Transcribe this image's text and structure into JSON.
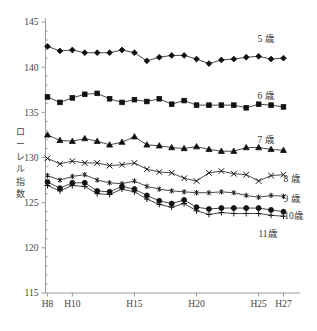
{
  "chart_data": {
    "type": "line",
    "title": "",
    "xlabel": "",
    "ylabel": "ローレル指数",
    "ylim": [
      115,
      145
    ],
    "y_ticks": [
      115,
      120,
      125,
      130,
      135,
      140,
      145
    ],
    "grid": false,
    "legend_position": "right-inline",
    "x": [
      "H8",
      "H9",
      "H10",
      "H11",
      "H12",
      "H13",
      "H14",
      "H15",
      "H16",
      "H17",
      "H18",
      "H19",
      "H20",
      "H21",
      "H22",
      "H23",
      "H24",
      "H25",
      "H26",
      "H27"
    ],
    "x_tick_labels": [
      "H8",
      "H10",
      "H15",
      "H20",
      "H25",
      "H27"
    ],
    "x_tick_values": [
      "H8",
      "H10",
      "H15",
      "H20",
      "H25",
      "H27"
    ],
    "series": [
      {
        "name": "5歳",
        "marker": "diamond",
        "values": [
          142.3,
          141.8,
          141.9,
          141.6,
          141.6,
          141.6,
          141.9,
          141.6,
          140.7,
          141.1,
          141.3,
          141.3,
          140.9,
          140.4,
          140.8,
          140.9,
          141.1,
          141.2,
          140.9,
          141.0
        ]
      },
      {
        "name": "6歳",
        "marker": "square",
        "values": [
          136.7,
          136.1,
          136.6,
          137.0,
          137.1,
          136.5,
          136.1,
          136.4,
          136.2,
          136.5,
          135.9,
          136.3,
          135.8,
          135.8,
          135.8,
          135.8,
          135.5,
          135.9,
          135.8,
          135.6
        ]
      },
      {
        "name": "7歳",
        "marker": "triangle",
        "values": [
          132.5,
          131.9,
          131.8,
          132.1,
          131.8,
          131.4,
          131.7,
          132.3,
          131.4,
          131.3,
          131.1,
          131.0,
          131.2,
          130.9,
          130.7,
          130.7,
          131.1,
          131.1,
          130.9,
          130.8
        ]
      },
      {
        "name": "8歳",
        "marker": "cross",
        "values": [
          129.9,
          129.3,
          129.6,
          129.4,
          129.4,
          129.1,
          129.2,
          129.4,
          128.7,
          128.4,
          128.3,
          127.7,
          127.4,
          128.3,
          128.5,
          128.2,
          128.1,
          127.4,
          128.0,
          128.1
        ]
      },
      {
        "name": "9歳",
        "marker": "star",
        "values": [
          128.0,
          127.5,
          127.9,
          128.1,
          127.5,
          127.2,
          127.1,
          127.4,
          126.8,
          126.5,
          126.3,
          126.2,
          126.1,
          126.1,
          126.2,
          126.1,
          125.8,
          125.6,
          125.8,
          125.7
        ]
      },
      {
        "name": "10歳",
        "marker": "circle",
        "values": [
          127.3,
          126.6,
          127.2,
          127.2,
          126.3,
          126.2,
          126.8,
          126.5,
          125.8,
          125.2,
          124.9,
          125.3,
          124.5,
          124.3,
          124.4,
          124.4,
          124.4,
          124.4,
          124.2,
          124.0
        ]
      },
      {
        "name": "11歳",
        "marker": "plus",
        "values": [
          126.9,
          126.3,
          126.9,
          126.8,
          126.0,
          125.9,
          126.5,
          126.2,
          125.4,
          124.8,
          124.5,
          124.9,
          124.1,
          123.7,
          123.9,
          123.8,
          123.8,
          123.8,
          123.6,
          123.5
        ]
      }
    ],
    "series_labels": [
      {
        "name": "5歳",
        "label": "5 歳"
      },
      {
        "name": "6歳",
        "label": "6 歳"
      },
      {
        "name": "7歳",
        "label": "7 歳"
      },
      {
        "name": "8歳",
        "label": "8 歳"
      },
      {
        "name": "9歳",
        "label": "9 歳"
      },
      {
        "name": "10歳",
        "label": "10歳"
      },
      {
        "name": "11歳",
        "label": "11歳"
      }
    ],
    "colors": {
      "line": "#111111",
      "marker": "#111111",
      "axis": "#9a9a9a",
      "text": "#3a3a3a",
      "background": "#ffffff"
    }
  },
  "axis": {
    "y_title_chars": [
      "ロ",
      "ー",
      "レ",
      "ル",
      "指",
      "数"
    ],
    "y_tick_labels": [
      "145",
      "140",
      "135",
      "130",
      "125",
      "120",
      "115"
    ],
    "x_tick_labels": [
      "H8",
      "H10",
      "H15",
      "H20",
      "H25",
      "H27"
    ]
  }
}
